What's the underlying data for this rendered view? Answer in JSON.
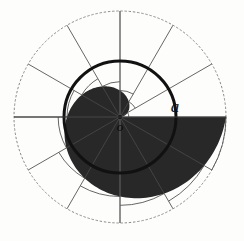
{
  "figure": {
    "center_label": "o",
    "radius_label": "a",
    "background_color": "#fdfdfc",
    "fill_color": "#282828",
    "line_color": "#555555",
    "outline_color": "#111111",
    "dotted_circle": {
      "center_x": 120,
      "center_y": 117,
      "radius": 106,
      "style": "dotted",
      "stroke_width": 1
    },
    "reference_circle": {
      "center_x": 120,
      "center_y": 117,
      "radius": 56,
      "style": "solid-thick",
      "stroke_width": 3
    },
    "spiral": {
      "type": "archimedean",
      "turns": 1,
      "start_angle_deg": 90,
      "direction": "clockwise",
      "max_radius": 106,
      "sectors": 12,
      "sector_angle_deg": 30,
      "sampled_radii": [
        {
          "angle_deg": 0,
          "radius": 106
        },
        {
          "angle_deg": 30,
          "radius": 97
        },
        {
          "angle_deg": 60,
          "radius": 88
        },
        {
          "angle_deg": 90,
          "radius": 80
        },
        {
          "angle_deg": 120,
          "radius": 71
        },
        {
          "angle_deg": 150,
          "radius": 62
        },
        {
          "angle_deg": 180,
          "radius": 53
        },
        {
          "angle_deg": 210,
          "radius": 44
        },
        {
          "angle_deg": 240,
          "radius": 35
        },
        {
          "angle_deg": 270,
          "radius": 27
        },
        {
          "angle_deg": 300,
          "radius": 18
        },
        {
          "angle_deg": 330,
          "radius": 9
        },
        {
          "angle_deg": 360,
          "radius": 0
        }
      ]
    },
    "radial_divisions": [
      0,
      30,
      60,
      90,
      120,
      150,
      180,
      210,
      240,
      270,
      300,
      330
    ],
    "caption": ""
  }
}
